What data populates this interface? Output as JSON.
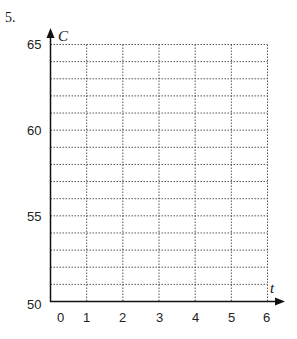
{
  "question_number": "5.",
  "chart_data": {
    "type": "line",
    "title": "",
    "xlabel": "t",
    "ylabel": "C",
    "xlim": [
      0,
      6
    ],
    "ylim": [
      50,
      65
    ],
    "x_ticks": [
      "0",
      "1",
      "2",
      "3",
      "4",
      "5",
      "6"
    ],
    "y_ticks": [
      "50",
      "55",
      "60",
      "65"
    ],
    "grid": true,
    "grid_style": "dotted",
    "y_minor_step": 1,
    "x_step": 1,
    "series": []
  },
  "labels": {
    "x_axis": "t",
    "y_axis": "C",
    "x0": "0",
    "x1": "1",
    "x2": "2",
    "x3": "3",
    "x4": "4",
    "x5": "5",
    "x6": "6",
    "y50": "50",
    "y55": "55",
    "y60": "60",
    "y65": "65"
  }
}
